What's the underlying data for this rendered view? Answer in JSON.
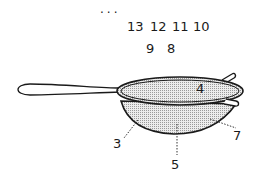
{
  "diagram": {
    "ellipsis": "...",
    "top_row_numbers": [
      "13",
      "12",
      "11",
      "10"
    ],
    "second_row_numbers": [
      "9",
      "8"
    ],
    "callouts": {
      "rim_label": "4",
      "left_bowl_label": "3",
      "bottom_label": "5",
      "right_label": "7"
    },
    "colors": {
      "line": "#1a1a1a",
      "mesh_fill": "#d9d9d9"
    }
  }
}
